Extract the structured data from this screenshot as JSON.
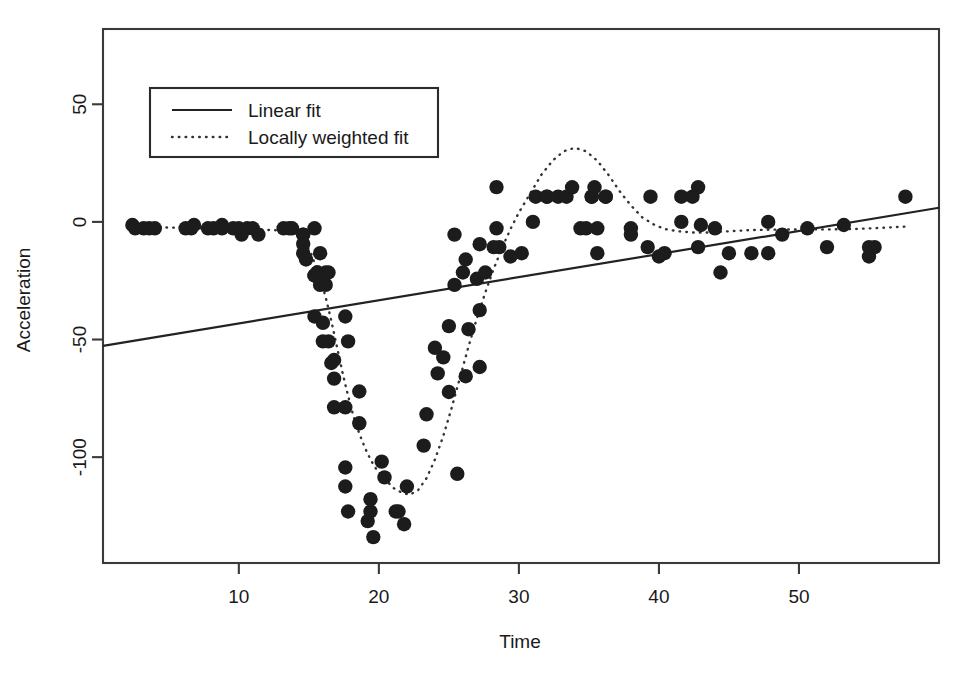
{
  "chart_data": {
    "type": "scatter",
    "title": "",
    "xlabel": "Time",
    "ylabel": "Acceleration",
    "xlim": [
      0.3,
      60.0
    ],
    "ylim": [
      -145,
      82
    ],
    "grid": false,
    "xticks": [
      10,
      20,
      30,
      40,
      50
    ],
    "xtick_labels": [
      "10",
      "20",
      "30",
      "40",
      "50"
    ],
    "yticks": [
      50,
      0,
      -50,
      -100
    ],
    "ytick_labels": [
      "50",
      "0",
      "-50",
      "-100"
    ],
    "legend_position": "top-left",
    "legend": [
      {
        "label": "Linear fit",
        "style": "solid",
        "key": "linear-fit-key"
      },
      {
        "label": "Locally weighted fit",
        "style": "dotted",
        "key": "loess-fit-key"
      }
    ],
    "series": [
      {
        "name": "Observations",
        "type": "scatter",
        "marker": "filled-circle",
        "color": "#1c1c1c",
        "points": [
          [
            2.4,
            -1.3
          ],
          [
            2.6,
            -2.7
          ],
          [
            3.2,
            -2.7
          ],
          [
            3.6,
            -2.7
          ],
          [
            4.0,
            -2.7
          ],
          [
            6.2,
            -2.7
          ],
          [
            6.6,
            -2.7
          ],
          [
            6.8,
            -1.3
          ],
          [
            7.8,
            -2.7
          ],
          [
            8.2,
            -2.7
          ],
          [
            8.8,
            -1.3
          ],
          [
            8.8,
            -2.7
          ],
          [
            9.6,
            -2.7
          ],
          [
            10.0,
            -2.7
          ],
          [
            10.2,
            -5.4
          ],
          [
            10.6,
            -2.7
          ],
          [
            11.0,
            -2.7
          ],
          [
            11.4,
            -5.4
          ],
          [
            13.2,
            -2.7
          ],
          [
            13.6,
            -2.7
          ],
          [
            13.8,
            -2.7
          ],
          [
            14.6,
            -13.3
          ],
          [
            14.6,
            -5.4
          ],
          [
            14.6,
            -5.4
          ],
          [
            14.6,
            -9.3
          ],
          [
            14.8,
            -16.0
          ],
          [
            15.4,
            -22.8
          ],
          [
            15.4,
            -2.7
          ],
          [
            15.4,
            -22.8
          ],
          [
            15.4,
            -40.2
          ],
          [
            15.6,
            -21.5
          ],
          [
            15.6,
            -21.5
          ],
          [
            15.8,
            -26.8
          ],
          [
            15.8,
            -13.3
          ],
          [
            16.0,
            -50.8
          ],
          [
            16.0,
            -42.9
          ],
          [
            16.2,
            -21.5
          ],
          [
            16.2,
            -26.8
          ],
          [
            16.4,
            -21.5
          ],
          [
            16.4,
            -50.8
          ],
          [
            16.6,
            -60.0
          ],
          [
            16.8,
            -58.7
          ],
          [
            16.8,
            -78.8
          ],
          [
            16.8,
            -66.6
          ],
          [
            17.6,
            -40.2
          ],
          [
            17.6,
            -78.8
          ],
          [
            17.6,
            -104.4
          ],
          [
            17.6,
            -112.5
          ],
          [
            17.8,
            -50.8
          ],
          [
            17.8,
            -123.1
          ],
          [
            18.6,
            -85.6
          ],
          [
            18.6,
            -72.1
          ],
          [
            19.2,
            -127.2
          ],
          [
            19.4,
            -123.1
          ],
          [
            19.4,
            -117.9
          ],
          [
            19.6,
            -134.0
          ],
          [
            20.2,
            -101.9
          ],
          [
            20.4,
            -108.6
          ],
          [
            21.2,
            -123.1
          ],
          [
            21.4,
            -123.1
          ],
          [
            21.8,
            -128.5
          ],
          [
            22.0,
            -112.5
          ],
          [
            23.2,
            -95.1
          ],
          [
            23.4,
            -81.8
          ],
          [
            24.0,
            -53.5
          ],
          [
            24.2,
            -64.4
          ],
          [
            24.6,
            -57.6
          ],
          [
            25.0,
            -72.3
          ],
          [
            25.0,
            -44.3
          ],
          [
            25.4,
            -26.8
          ],
          [
            25.4,
            -5.4
          ],
          [
            25.6,
            -107.1
          ],
          [
            26.0,
            -21.5
          ],
          [
            26.2,
            -65.6
          ],
          [
            26.2,
            -16.0
          ],
          [
            26.4,
            -45.6
          ],
          [
            27.0,
            -24.2
          ],
          [
            27.2,
            -9.5
          ],
          [
            27.2,
            -61.7
          ],
          [
            27.2,
            -37.5
          ],
          [
            27.6,
            -21.5
          ],
          [
            28.2,
            -10.7
          ],
          [
            28.4,
            14.8
          ],
          [
            28.4,
            -2.7
          ],
          [
            28.6,
            -10.7
          ],
          [
            29.4,
            -14.7
          ],
          [
            30.2,
            -13.3
          ],
          [
            31.0,
            0.0
          ],
          [
            31.2,
            10.7
          ],
          [
            32.0,
            10.7
          ],
          [
            32.0,
            10.7
          ],
          [
            32.8,
            10.7
          ],
          [
            33.4,
            10.7
          ],
          [
            33.8,
            14.7
          ],
          [
            34.4,
            -2.7
          ],
          [
            34.8,
            -2.7
          ],
          [
            35.2,
            10.7
          ],
          [
            35.2,
            10.7
          ],
          [
            35.4,
            14.7
          ],
          [
            35.6,
            -13.3
          ],
          [
            35.6,
            -2.7
          ],
          [
            36.2,
            10.7
          ],
          [
            36.2,
            10.7
          ],
          [
            38.0,
            -5.4
          ],
          [
            38.0,
            -2.7
          ],
          [
            39.2,
            -10.7
          ],
          [
            39.4,
            10.7
          ],
          [
            40.0,
            -14.7
          ],
          [
            40.4,
            -13.3
          ],
          [
            41.6,
            0.0
          ],
          [
            41.6,
            10.7
          ],
          [
            42.4,
            10.7
          ],
          [
            42.8,
            -10.7
          ],
          [
            42.8,
            14.7
          ],
          [
            43.0,
            -1.3
          ],
          [
            44.0,
            -2.7
          ],
          [
            44.4,
            -21.5
          ],
          [
            45.0,
            -13.3
          ],
          [
            46.6,
            -13.3
          ],
          [
            47.8,
            -13.3
          ],
          [
            47.8,
            0.0
          ],
          [
            48.8,
            -5.4
          ],
          [
            50.6,
            -2.7
          ],
          [
            52.0,
            -10.7
          ],
          [
            53.2,
            -1.3
          ],
          [
            55.0,
            -14.7
          ],
          [
            55.0,
            -10.7
          ],
          [
            55.4,
            -10.7
          ],
          [
            57.6,
            10.7
          ]
        ]
      },
      {
        "name": "Linear fit",
        "type": "line",
        "style": "solid",
        "color": "#222222",
        "endpoints": [
          [
            0.3,
            -52.7
          ],
          [
            60.0,
            6.0
          ]
        ]
      },
      {
        "name": "Locally weighted fit",
        "type": "line",
        "style": "dotted",
        "color": "#333333",
        "points": [
          [
            2.4,
            -2.0
          ],
          [
            5.0,
            -2.4
          ],
          [
            8.0,
            -2.8
          ],
          [
            11.0,
            -3.2
          ],
          [
            13.0,
            -3.6
          ],
          [
            14.0,
            -4.5
          ],
          [
            14.6,
            -7.0
          ],
          [
            15.2,
            -14.0
          ],
          [
            15.8,
            -24.0
          ],
          [
            16.2,
            -32.0
          ],
          [
            16.6,
            -42.0
          ],
          [
            17.0,
            -53.0
          ],
          [
            17.4,
            -64.0
          ],
          [
            17.8,
            -74.0
          ],
          [
            18.2,
            -83.0
          ],
          [
            18.6,
            -90.0
          ],
          [
            19.0,
            -96.0
          ],
          [
            19.4,
            -101.0
          ],
          [
            19.8,
            -105.0
          ],
          [
            20.4,
            -109.0
          ],
          [
            21.0,
            -113.0
          ],
          [
            21.6,
            -115.0
          ],
          [
            22.2,
            -116.0
          ],
          [
            22.8,
            -114.0
          ],
          [
            23.4,
            -109.0
          ],
          [
            24.0,
            -101.0
          ],
          [
            24.6,
            -91.0
          ],
          [
            25.2,
            -79.0
          ],
          [
            25.8,
            -66.0
          ],
          [
            26.4,
            -53.0
          ],
          [
            27.0,
            -41.0
          ],
          [
            27.6,
            -30.0
          ],
          [
            28.2,
            -20.0
          ],
          [
            28.8,
            -11.0
          ],
          [
            29.4,
            -3.0
          ],
          [
            30.0,
            4.0
          ],
          [
            30.8,
            12.0
          ],
          [
            31.6,
            20.0
          ],
          [
            32.4,
            26.0
          ],
          [
            33.2,
            30.0
          ],
          [
            34.0,
            31.5
          ],
          [
            34.8,
            30.0
          ],
          [
            35.6,
            26.0
          ],
          [
            36.4,
            20.0
          ],
          [
            37.2,
            13.0
          ],
          [
            38.0,
            7.0
          ],
          [
            38.8,
            2.0
          ],
          [
            39.6,
            -1.0
          ],
          [
            40.4,
            -3.0
          ],
          [
            41.4,
            -4.0
          ],
          [
            42.4,
            -4.5
          ],
          [
            43.6,
            -4.5
          ],
          [
            45.0,
            -4.0
          ],
          [
            46.5,
            -3.5
          ],
          [
            48.0,
            -3.3
          ],
          [
            50.0,
            -3.2
          ],
          [
            52.0,
            -3.2
          ],
          [
            54.0,
            -3.0
          ],
          [
            56.0,
            -2.5
          ],
          [
            57.6,
            -2.0
          ]
        ]
      }
    ]
  },
  "axes": {
    "x_axis_name": "time-axis",
    "y_axis_name": "acceleration-axis"
  }
}
